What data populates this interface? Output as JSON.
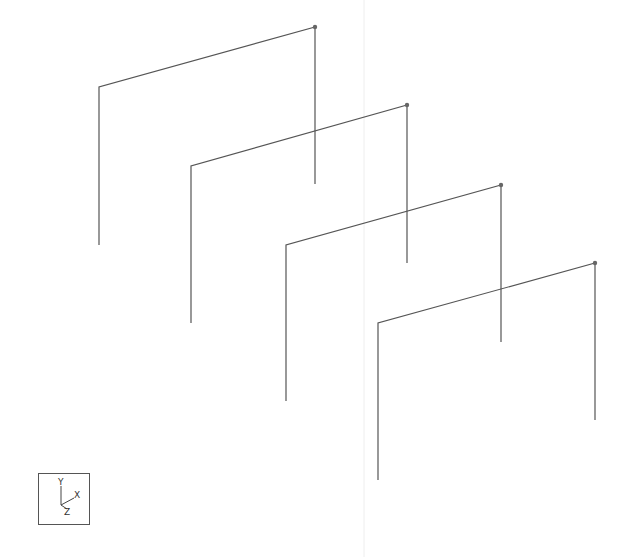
{
  "viewport": {
    "background": "#ffffff",
    "line_color": "#555555",
    "node_color": "#666666",
    "guide_line": {
      "x": 364,
      "color": "#eeeeee"
    }
  },
  "frames": [
    {
      "id": "frame-1",
      "left_base": [
        99,
        245
      ],
      "left_top": [
        99,
        87
      ],
      "right_top": [
        315,
        27
      ],
      "right_base": [
        315,
        184
      ]
    },
    {
      "id": "frame-2",
      "left_base": [
        191,
        323
      ],
      "left_top": [
        191,
        166
      ],
      "right_top": [
        407,
        105
      ],
      "right_base": [
        407,
        263
      ]
    },
    {
      "id": "frame-3",
      "left_base": [
        286,
        401
      ],
      "left_top": [
        286,
        245
      ],
      "right_top": [
        501,
        185
      ],
      "right_base": [
        501,
        342
      ]
    },
    {
      "id": "frame-4",
      "left_base": [
        378,
        480
      ],
      "left_top": [
        378,
        323
      ],
      "right_top": [
        595,
        263
      ],
      "right_base": [
        595,
        420
      ]
    }
  ],
  "axis_triad": {
    "y_label": "Y",
    "x_label": "X",
    "z_label": "Z"
  }
}
